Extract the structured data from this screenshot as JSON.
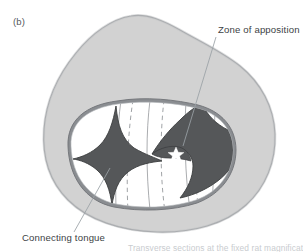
{
  "figure": {
    "panel_label": "(b)",
    "type": "anatomical-cross-section-diagram",
    "background_color": "#ffffff"
  },
  "annotations": [
    {
      "id": "zone-of-apposition",
      "label": "Zone of apposition",
      "text_x": 218,
      "text_y": 33,
      "leader_from": [
        216,
        37
      ],
      "leader_to": [
        183,
        146
      ]
    },
    {
      "id": "connecting-tongue",
      "label": "Connecting tongue",
      "text_x": 22,
      "text_y": 241,
      "leader_from": [
        74,
        232
      ],
      "leader_to": [
        110,
        168
      ]
    }
  ],
  "caption_partial": "Transverse sections at the fixed rat magnification",
  "colors": {
    "body_fill": "#d2d2d2",
    "body_stroke": "#8e9195",
    "cavity_fill": "#ffffff",
    "cavity_ring": "#8a8d91",
    "wing_fill": "#555759",
    "wing_stroke": "#3c3e40",
    "dashed_line": "#9b9ea1",
    "thin_line": "#8d9094",
    "leader_line": "#9aa0a5",
    "label_text": "#3d4245",
    "panel_label_text": "#55595c",
    "star_marker": "#ffffff"
  },
  "shapes": {
    "outer_body": {
      "name": "abdominal-wall-outline",
      "description": "Large rounded irregular closed contour filling most of the panel"
    },
    "inner_cavity": {
      "name": "peritoneal-cavity",
      "description": "Kidney-bean shaped white interior bounded by a gray ring"
    },
    "wing_left": {
      "name": "diaphragm-crus-left",
      "description": "Dark concave four-pointed star-like wing on the left of the cavity"
    },
    "wing_right": {
      "name": "diaphragm-crus-right",
      "description": "Dark swept wing on the right of the cavity tapering to a point"
    },
    "star_marker": {
      "name": "asterisk-marker",
      "description": "Small white star within the right dark wing"
    },
    "dashed_lines_count": 3,
    "thin_lines_count": 4
  }
}
